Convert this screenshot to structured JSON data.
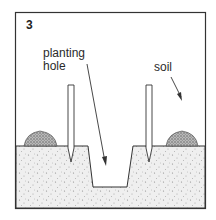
{
  "figure": {
    "number": "3",
    "labels": {
      "planting_hole": "planting\nhole",
      "planting_hole_line1": "planting",
      "planting_hole_line2": "hole",
      "soil": "soil"
    }
  },
  "colors": {
    "frame": "#333333",
    "ground_fill": "#eeeeee",
    "soil_fill": "#999999",
    "stake_fill": "#ffffff",
    "line": "#333333"
  }
}
